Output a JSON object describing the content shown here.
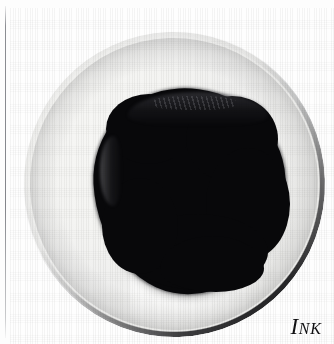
{
  "figure": {
    "caption": {
      "full_text": "INK",
      "initial": "I",
      "rest": "NK"
    },
    "subject": {
      "name": "ink-blob-in-dish",
      "description": "Large irregular black ink pool filling a shallow white ceramic dish",
      "ink_color": "#08080a",
      "dish_color": "#f4f4f2",
      "rim_color": "#1e1e20",
      "background_color": "#fdfdfd"
    },
    "elements": {
      "margin_rule_name": "vertical-margin-rule",
      "dish_name": "ceramic-dish",
      "ink_name": "ink-pool",
      "highlight_name": "specular-highlight",
      "texture_name": "canvas-texture"
    }
  }
}
